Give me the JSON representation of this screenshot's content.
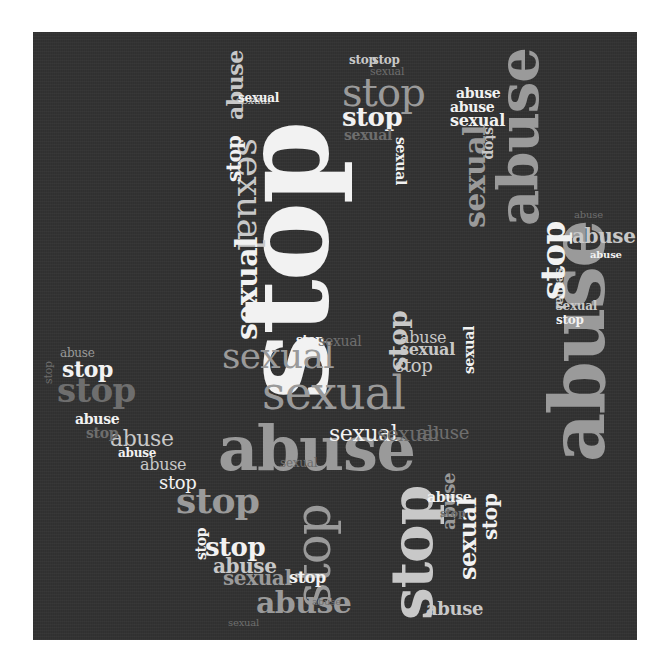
{
  "image": {
    "description": "Word cloud shaped like an open hand (stop gesture) on a dark textured background",
    "background_color": "#ffffff",
    "panel_color": "#333333",
    "palette": {
      "white": "#f2f2f2",
      "light": "#c8c8c8",
      "mid": "#9a9a9a",
      "dim": "#6e6e6e"
    }
  },
  "words": [
    {
      "text": "stop",
      "x": 225,
      "y": 400,
      "size": 120,
      "rot": -90,
      "color": "white",
      "bold": true
    },
    {
      "text": "abuse",
      "x": 218,
      "y": 418,
      "size": 62,
      "rot": 0,
      "color": "mid",
      "bold": true
    },
    {
      "text": "sexual",
      "x": 262,
      "y": 370,
      "size": 46,
      "rot": 0,
      "color": "mid",
      "bold": false
    },
    {
      "text": "sexual",
      "x": 222,
      "y": 338,
      "size": 36,
      "rot": 0,
      "color": "mid",
      "bold": false
    },
    {
      "text": "abuse",
      "x": 540,
      "y": 462,
      "size": 76,
      "rot": -90,
      "color": "mid",
      "bold": true
    },
    {
      "text": "stop",
      "x": 383,
      "y": 620,
      "size": 58,
      "rot": -90,
      "color": "light",
      "bold": true
    },
    {
      "text": "stop",
      "x": 288,
      "y": 608,
      "size": 50,
      "rot": -90,
      "color": "mid",
      "bold": false
    },
    {
      "text": "stop",
      "x": 176,
      "y": 482,
      "size": 36,
      "rot": 0,
      "color": "mid",
      "bold": true
    },
    {
      "text": "abuse",
      "x": 256,
      "y": 588,
      "size": 30,
      "rot": 0,
      "color": "mid",
      "bold": true
    },
    {
      "text": "abuse",
      "x": 490,
      "y": 226,
      "size": 56,
      "rot": -90,
      "color": "mid",
      "bold": true
    },
    {
      "text": "sexual",
      "x": 268,
      "y": 138,
      "size": 36,
      "rot": 90,
      "color": "light",
      "bold": false
    },
    {
      "text": "sexual",
      "x": 232,
      "y": 340,
      "size": 30,
      "rot": -90,
      "color": "white",
      "bold": true
    },
    {
      "text": "sexual",
      "x": 460,
      "y": 228,
      "size": 30,
      "rot": -90,
      "color": "mid",
      "bold": true
    },
    {
      "text": "stop",
      "x": 342,
      "y": 72,
      "size": 40,
      "rot": 0,
      "color": "mid",
      "bold": false
    },
    {
      "text": "stop",
      "x": 342,
      "y": 104,
      "size": 26,
      "rot": 0,
      "color": "white",
      "bold": true
    },
    {
      "text": "stop",
      "x": 349,
      "y": 54,
      "size": 12,
      "rot": 0,
      "color": "light",
      "bold": true
    },
    {
      "text": "stop",
      "x": 372,
      "y": 54,
      "size": 12,
      "rot": 0,
      "color": "light",
      "bold": true
    },
    {
      "text": "sexual",
      "x": 370,
      "y": 66,
      "size": 11,
      "rot": 0,
      "color": "dim",
      "bold": false
    },
    {
      "text": "sexual",
      "x": 344,
      "y": 128,
      "size": 14,
      "rot": 0,
      "color": "dim",
      "bold": true
    },
    {
      "text": "sexual",
      "x": 408,
      "y": 137,
      "size": 14,
      "rot": 90,
      "color": "white",
      "bold": true
    },
    {
      "text": "abuse",
      "x": 456,
      "y": 86,
      "size": 14,
      "rot": 0,
      "color": "white",
      "bold": true
    },
    {
      "text": "abuse",
      "x": 450,
      "y": 100,
      "size": 14,
      "rot": 0,
      "color": "white",
      "bold": true
    },
    {
      "text": "sexual",
      "x": 450,
      "y": 113,
      "size": 16,
      "rot": 0,
      "color": "white",
      "bold": true
    },
    {
      "text": "stop",
      "x": 497,
      "y": 127,
      "size": 14,
      "rot": 90,
      "color": "light",
      "bold": true
    },
    {
      "text": "abuse",
      "x": 224,
      "y": 120,
      "size": 22,
      "rot": -90,
      "color": "light",
      "bold": true
    },
    {
      "text": "stop",
      "x": 224,
      "y": 182,
      "size": 20,
      "rot": -90,
      "color": "white",
      "bold": true
    },
    {
      "text": "sexual",
      "x": 236,
      "y": 95,
      "size": 11,
      "rot": 0,
      "color": "light",
      "bold": false
    },
    {
      "text": "sexual",
      "x": 238,
      "y": 92,
      "size": 12,
      "rot": 0,
      "color": "white",
      "bold": true
    },
    {
      "text": "sexual",
      "x": 566,
      "y": 268,
      "size": 12,
      "rot": 90,
      "color": "light",
      "bold": true
    },
    {
      "text": "abuse",
      "x": 572,
      "y": 226,
      "size": 20,
      "rot": 0,
      "color": "light",
      "bold": true
    },
    {
      "text": "abuse",
      "x": 590,
      "y": 250,
      "size": 10,
      "rot": 0,
      "color": "white",
      "bold": true
    },
    {
      "text": "abuse",
      "x": 574,
      "y": 210,
      "size": 10,
      "rot": 0,
      "color": "dim",
      "bold": false
    },
    {
      "text": "stop",
      "x": 536,
      "y": 300,
      "size": 34,
      "rot": -90,
      "color": "white",
      "bold": true
    },
    {
      "text": "sexual",
      "x": 556,
      "y": 300,
      "size": 12,
      "rot": 0,
      "color": "light",
      "bold": true
    },
    {
      "text": "stop",
      "x": 556,
      "y": 314,
      "size": 12,
      "rot": 0,
      "color": "white",
      "bold": true
    },
    {
      "text": "stop",
      "x": 62,
      "y": 358,
      "size": 22,
      "rot": 0,
      "color": "white",
      "bold": true
    },
    {
      "text": "abuse",
      "x": 60,
      "y": 347,
      "size": 12,
      "rot": 0,
      "color": "mid",
      "bold": false
    },
    {
      "text": "stop",
      "x": 57,
      "y": 373,
      "size": 34,
      "rot": 0,
      "color": "dim",
      "bold": true
    },
    {
      "text": "abuse",
      "x": 75,
      "y": 412,
      "size": 14,
      "rot": 0,
      "color": "white",
      "bold": true
    },
    {
      "text": "abuse",
      "x": 110,
      "y": 428,
      "size": 22,
      "rot": 0,
      "color": "light",
      "bold": false
    },
    {
      "text": "stop",
      "x": 86,
      "y": 426,
      "size": 14,
      "rot": 0,
      "color": "dim",
      "bold": true
    },
    {
      "text": "abuse",
      "x": 140,
      "y": 457,
      "size": 16,
      "rot": 0,
      "color": "light",
      "bold": false
    },
    {
      "text": "abuse",
      "x": 118,
      "y": 447,
      "size": 12,
      "rot": 0,
      "color": "white",
      "bold": true
    },
    {
      "text": "stop",
      "x": 159,
      "y": 474,
      "size": 18,
      "rot": 0,
      "color": "white",
      "bold": false
    },
    {
      "text": "stop",
      "x": 43,
      "y": 384,
      "size": 11,
      "rot": -90,
      "color": "dim",
      "bold": false
    },
    {
      "text": "stop",
      "x": 205,
      "y": 534,
      "size": 26,
      "rot": 0,
      "color": "white",
      "bold": true
    },
    {
      "text": "abuse",
      "x": 213,
      "y": 556,
      "size": 20,
      "rot": 0,
      "color": "light",
      "bold": true
    },
    {
      "text": "sexual",
      "x": 223,
      "y": 568,
      "size": 20,
      "rot": 0,
      "color": "mid",
      "bold": true
    },
    {
      "text": "stop",
      "x": 289,
      "y": 570,
      "size": 16,
      "rot": 0,
      "color": "white",
      "bold": true
    },
    {
      "text": "stop",
      "x": 194,
      "y": 560,
      "size": 14,
      "rot": -90,
      "color": "white",
      "bold": true
    },
    {
      "text": "abuse",
      "x": 426,
      "y": 600,
      "size": 18,
      "rot": 0,
      "color": "light",
      "bold": true
    },
    {
      "text": "abuse",
      "x": 440,
      "y": 530,
      "size": 18,
      "rot": -90,
      "color": "mid",
      "bold": true
    },
    {
      "text": "sexual",
      "x": 456,
      "y": 580,
      "size": 24,
      "rot": -90,
      "color": "white",
      "bold": true
    },
    {
      "text": "stop",
      "x": 480,
      "y": 540,
      "size": 20,
      "rot": -90,
      "color": "white",
      "bold": true
    },
    {
      "text": "abuse",
      "x": 427,
      "y": 490,
      "size": 14,
      "rot": 0,
      "color": "white",
      "bold": true
    },
    {
      "text": "stop",
      "x": 440,
      "y": 508,
      "size": 11,
      "rot": 0,
      "color": "dim",
      "bold": true
    },
    {
      "text": "sexual",
      "x": 329,
      "y": 423,
      "size": 22,
      "rot": 0,
      "color": "white",
      "bold": false
    },
    {
      "text": "sexual",
      "x": 377,
      "y": 424,
      "size": 20,
      "rot": 0,
      "color": "dim",
      "bold": false
    },
    {
      "text": "abuse",
      "x": 417,
      "y": 424,
      "size": 18,
      "rot": 0,
      "color": "dim",
      "bold": false
    },
    {
      "text": "abuse",
      "x": 400,
      "y": 330,
      "size": 16,
      "rot": 0,
      "color": "light",
      "bold": false
    },
    {
      "text": "sexual",
      "x": 400,
      "y": 342,
      "size": 16,
      "rot": 0,
      "color": "light",
      "bold": true
    },
    {
      "text": "stop",
      "x": 395,
      "y": 357,
      "size": 18,
      "rot": 0,
      "color": "light",
      "bold": false
    },
    {
      "text": "stop",
      "x": 385,
      "y": 371,
      "size": 26,
      "rot": -90,
      "color": "light",
      "bold": true
    },
    {
      "text": "stop",
      "x": 296,
      "y": 334,
      "size": 12,
      "rot": 0,
      "color": "white",
      "bold": true
    },
    {
      "text": "sexual",
      "x": 318,
      "y": 334,
      "size": 14,
      "rot": 0,
      "color": "dim",
      "bold": false
    },
    {
      "text": "sexual",
      "x": 462,
      "y": 374,
      "size": 14,
      "rot": -90,
      "color": "white",
      "bold": true
    },
    {
      "text": "sexual",
      "x": 280,
      "y": 457,
      "size": 12,
      "rot": 0,
      "color": "dim",
      "bold": false
    },
    {
      "text": "abuse",
      "x": 312,
      "y": 597,
      "size": 10,
      "rot": 0,
      "color": "dim",
      "bold": false
    },
    {
      "text": "sexual",
      "x": 228,
      "y": 618,
      "size": 10,
      "rot": 0,
      "color": "dim",
      "bold": false
    }
  ]
}
